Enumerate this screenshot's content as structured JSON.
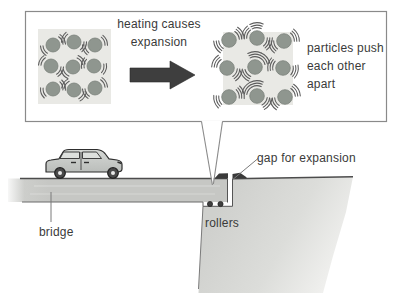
{
  "callout": {
    "heating_label": "heating causes expansion",
    "particles_label": "particles push each other apart"
  },
  "labels": {
    "bridge": "bridge",
    "rollers": "rollers",
    "gap": "gap for expansion"
  },
  "colors": {
    "particle_fill": "#8f968f",
    "particle_stroke": "#7b827b",
    "particle_box_bg": "#e9e9e5",
    "vibration_stroke": "#5c5c5c",
    "deck_gray": "#c6c7c4",
    "ground_gray": "#d0d1ce",
    "arrow_dark": "#3e3e3e",
    "outline": "#4c4c4c",
    "callout_border": "#8a8a8a",
    "text": "#3a3a3a"
  },
  "figure": {
    "left_particles": {
      "state": "before heating (close together)",
      "box": [
        38,
        29,
        73,
        75
      ],
      "radius": 7,
      "arc_rings": 2,
      "centers": [
        [
          53,
          45
        ],
        [
          74,
          42
        ],
        [
          95,
          45
        ],
        [
          51,
          66
        ],
        [
          73,
          67
        ],
        [
          94,
          66
        ],
        [
          53,
          89
        ],
        [
          74,
          90
        ],
        [
          95,
          88
        ]
      ]
    },
    "right_particles": {
      "state": "after heating (spread apart)",
      "box": [
        223,
        32,
        70,
        73
      ],
      "radius": 7.3,
      "arc_rings": 3,
      "centers": [
        [
          229,
          40
        ],
        [
          257,
          38
        ],
        [
          284,
          41
        ],
        [
          227,
          68
        ],
        [
          255,
          67
        ],
        [
          283,
          68
        ],
        [
          229,
          97
        ],
        [
          257,
          96
        ],
        [
          285,
          97
        ]
      ]
    }
  }
}
